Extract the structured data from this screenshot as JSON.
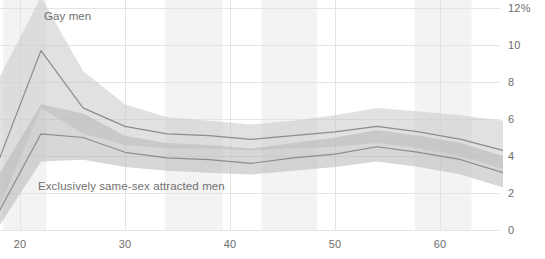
{
  "chart_data": {
    "type": "line",
    "title": "",
    "subtitle": "",
    "xlabel": "",
    "ylabel": "",
    "xlim": [
      18,
      66
    ],
    "ylim": [
      0,
      12
    ],
    "grid": true,
    "legend_position": "inline-annotation",
    "y_tick_labels": [
      "12%",
      "10",
      "8",
      "6",
      "4",
      "2",
      "0"
    ],
    "y_ticks": [
      12,
      10,
      8,
      6,
      4,
      2,
      0
    ],
    "x_tick_labels": [
      "20",
      "30",
      "40",
      "50",
      "60"
    ],
    "x_ticks": [
      20,
      30,
      40,
      50,
      60
    ],
    "series": [
      {
        "name": "Gay men",
        "color": "#8c8c8c",
        "band_color": "#c9c9c9",
        "x": [
          18,
          22,
          26,
          30,
          34,
          38,
          42,
          46,
          50,
          54,
          58,
          62,
          66
        ],
        "values": [
          3.8,
          9.7,
          6.6,
          5.6,
          5.2,
          5.1,
          4.9,
          5.1,
          5.3,
          5.6,
          5.3,
          4.9,
          4.3
        ],
        "band_low": [
          1.2,
          6.6,
          5.2,
          4.6,
          4.4,
          4.4,
          4.3,
          4.4,
          4.5,
          4.7,
          4.4,
          4.0,
          3.3
        ],
        "band_high": [
          8.2,
          12.6,
          8.6,
          6.8,
          6.1,
          5.9,
          5.7,
          5.9,
          6.2,
          6.6,
          6.4,
          6.2,
          5.9
        ]
      },
      {
        "name": "Exclusively same-sex attracted men",
        "color": "#8c8c8c",
        "band_color": "#b6b6b6",
        "x": [
          18,
          22,
          26,
          30,
          34,
          38,
          42,
          46,
          50,
          54,
          58,
          62,
          66
        ],
        "values": [
          1.0,
          5.2,
          5.0,
          4.2,
          3.9,
          3.8,
          3.6,
          3.9,
          4.1,
          4.5,
          4.2,
          3.8,
          3.1
        ],
        "band_low": [
          0.2,
          3.7,
          3.8,
          3.4,
          3.2,
          3.1,
          3.0,
          3.2,
          3.4,
          3.7,
          3.4,
          3.0,
          2.3
        ],
        "band_high": [
          3.0,
          6.8,
          6.3,
          5.1,
          4.7,
          4.6,
          4.4,
          4.7,
          5.0,
          5.4,
          5.1,
          4.7,
          4.0
        ]
      }
    ],
    "shaded_x_bands": [
      {
        "from": 18.4,
        "to": 22.5
      },
      {
        "from": 33.8,
        "to": 39.3
      },
      {
        "from": 43.0,
        "to": 48.3
      },
      {
        "from": 57.6,
        "to": 63.0
      }
    ],
    "annotations": [
      {
        "text": "Gay men",
        "x": 22.4,
        "y": 11.5
      },
      {
        "text": "Exclusively same-sex attracted men",
        "x": 20.0,
        "y": 3.0
      }
    ]
  },
  "labels": {
    "gay_men": "Gay men",
    "exclusively_same_sex": "Exclusively same-sex attracted men"
  },
  "y_axis": {
    "t0": "12%",
    "t1": "10",
    "t2": "8",
    "t3": "6",
    "t4": "4",
    "t5": "2",
    "t6": "0"
  },
  "x_axis": {
    "t0": "20",
    "t1": "30",
    "t2": "40",
    "t3": "50",
    "t4": "60"
  },
  "colors": {
    "line": "#8c8c8c",
    "band_light": "#cfcfcf",
    "band_dark": "#b0b0b0",
    "grid": "#e4e4e4",
    "axis_text": "#6d6d6d",
    "background": "#ffffff",
    "shade_band": "#f3f3f3"
  }
}
